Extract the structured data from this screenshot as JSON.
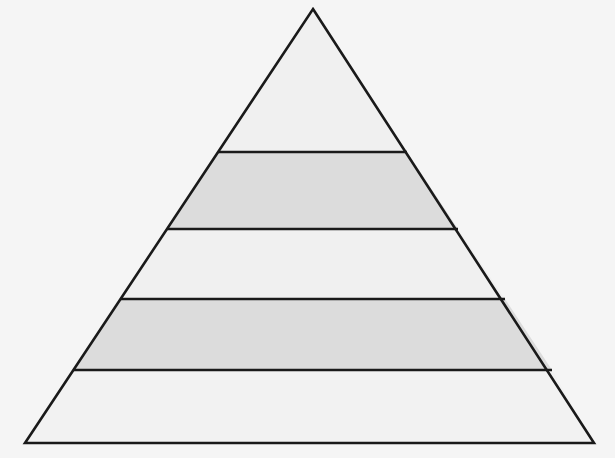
{
  "diagram": {
    "type": "pyramid",
    "title": "",
    "level_count": 5,
    "background_color": "#f5f5f5",
    "outline_color": "#1a1a1a",
    "outline_width": 2.6,
    "divider_color": "#1a1a1a",
    "divider_width": 2.6,
    "geometry": {
      "apex": {
        "x": 313,
        "y": 9
      },
      "bottom_left": {
        "x": 25,
        "y": 443
      },
      "bottom_right": {
        "x": 594,
        "y": 443
      },
      "divider_y_values": [
        152,
        229,
        299,
        370
      ]
    },
    "levels": [
      {
        "index": 1,
        "name": "level-1-apex",
        "label": "",
        "fill_color": "#f0f0f0",
        "top_y": 9,
        "bottom_y": 152,
        "left_x_top": 313,
        "right_x_top": 313,
        "left_x_bottom": 218,
        "right_x_bottom": 407
      },
      {
        "index": 2,
        "name": "level-2",
        "label": "",
        "fill_color": "#dcdcdc",
        "top_y": 152,
        "bottom_y": 229,
        "left_x_top": 218,
        "right_x_top": 407,
        "left_x_bottom": 167,
        "right_x_bottom": 458
      },
      {
        "index": 3,
        "name": "level-3",
        "label": "",
        "fill_color": "#f0f0f0",
        "top_y": 229,
        "bottom_y": 299,
        "left_x_top": 167,
        "right_x_top": 458,
        "left_x_bottom": 120,
        "right_x_bottom": 505
      },
      {
        "index": 4,
        "name": "level-4",
        "label": "",
        "fill_color": "#dcdcdc",
        "top_y": 299,
        "bottom_y": 370,
        "left_x_top": 120,
        "right_x_top": 505,
        "left_x_bottom": 73,
        "right_x_bottom": 552
      },
      {
        "index": 5,
        "name": "level-5-base",
        "label": "",
        "fill_color": "#f2f2f2",
        "top_y": 370,
        "bottom_y": 443,
        "left_x_top": 73,
        "right_x_top": 552,
        "left_x_bottom": 25,
        "right_x_bottom": 594
      }
    ]
  }
}
